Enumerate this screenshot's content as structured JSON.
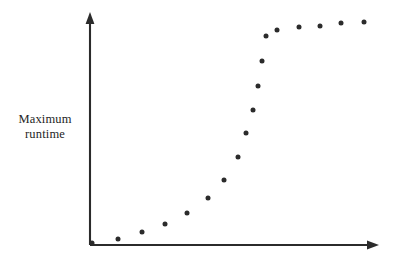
{
  "figure": {
    "background_color": "#ffffff",
    "ink_color": "#2b2b2b",
    "width": 407,
    "height": 273
  },
  "axes": {
    "y_label_line1": "Maximum",
    "y_label_line2": "runtime",
    "x_label": "",
    "y_axis_name": "y-axis",
    "x_axis_name": "x-axis",
    "has_ticks": false,
    "has_tick_labels": false,
    "has_gridlines": false,
    "arrowheads": true,
    "origin_px": {
      "x": 90,
      "y": 245
    },
    "y_axis_top_px": 14,
    "x_axis_right_px": 378
  },
  "chart_data": {
    "type": "scatter",
    "title": "",
    "xlabel": "",
    "ylabel": "Maximum runtime",
    "grid": false,
    "legend": "none",
    "xlim": [
      0,
      18
    ],
    "ylim": [
      0,
      100
    ],
    "x": [
      0,
      1,
      2,
      3,
      4,
      5,
      6,
      7,
      8,
      9,
      10,
      11,
      12,
      13,
      14,
      15,
      16
    ],
    "values": [
      0.5,
      2.5,
      4.5,
      7.5,
      11,
      16,
      23,
      32,
      43,
      56,
      69,
      80,
      88,
      93,
      95.5,
      97,
      98
    ],
    "point_count": 17,
    "marker": "filled-circle",
    "marker_color": "#2b2b2b",
    "marker_diameter_px": 5,
    "shape_description": "sigmoid / S-curve: flat near origin, steep central rise, plateau at right",
    "points_px": [
      {
        "x": 92,
        "y": 243
      },
      {
        "x": 118,
        "y": 239
      },
      {
        "x": 142,
        "y": 232
      },
      {
        "x": 165,
        "y": 224
      },
      {
        "x": 187,
        "y": 213
      },
      {
        "x": 208,
        "y": 198
      },
      {
        "x": 224,
        "y": 180
      },
      {
        "x": 238,
        "y": 157
      },
      {
        "x": 246,
        "y": 133
      },
      {
        "x": 253,
        "y": 110
      },
      {
        "x": 258,
        "y": 86
      },
      {
        "x": 262,
        "y": 61
      },
      {
        "x": 266,
        "y": 36
      },
      {
        "x": 277,
        "y": 30
      },
      {
        "x": 299,
        "y": 27
      },
      {
        "x": 320,
        "y": 26
      },
      {
        "x": 341,
        "y": 23
      },
      {
        "x": 364,
        "y": 22
      }
    ]
  }
}
